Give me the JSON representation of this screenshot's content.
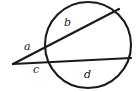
{
  "figure": {
    "kind": "geometry-diagram",
    "background_color": "#ffffff",
    "stroke_color": "#1a1a1a",
    "label_color": "#1a1a1a",
    "circle": {
      "center_x": 88,
      "center_y": 45,
      "radius": 43,
      "stroke_width": 2.1
    },
    "external_vertex": {
      "x": 13,
      "y": 64
    },
    "secants": [
      {
        "name": "upper-secant",
        "from_x": 13,
        "from_y": 64,
        "to_x": 119,
        "to_y": 9,
        "stroke_width": 2.2,
        "external_segment_label": "a",
        "chord_label": "b"
      },
      {
        "name": "lower-secant",
        "from_x": 13,
        "from_y": 64,
        "to_x": 131,
        "to_y": 58,
        "stroke_width": 2.2,
        "external_segment_label": "c",
        "chord_label": "d"
      }
    ],
    "labels": [
      {
        "id": "a",
        "text": "a",
        "x": 24,
        "y": 41,
        "role": "external-segment-upper"
      },
      {
        "id": "b",
        "text": "b",
        "x": 64,
        "y": 17,
        "role": "chord-upper"
      },
      {
        "id": "c",
        "text": "c",
        "x": 33,
        "y": 64,
        "role": "external-segment-lower"
      },
      {
        "id": "d",
        "text": "d",
        "x": 84,
        "y": 69,
        "role": "chord-lower"
      }
    ]
  }
}
